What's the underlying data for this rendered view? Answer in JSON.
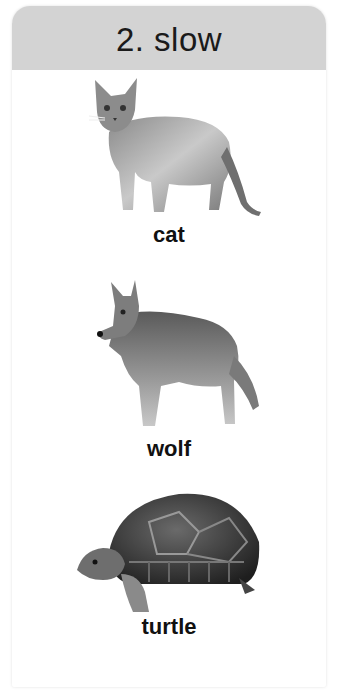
{
  "card": {
    "title": "2. slow",
    "header_color": "#d3d3d3"
  },
  "items": [
    {
      "name": "cat",
      "image": "cat-illustration",
      "label": "cat"
    },
    {
      "name": "wolf",
      "image": "wolf-illustration",
      "label": "wolf"
    },
    {
      "name": "turtle",
      "image": "turtle-illustration",
      "label": "turtle"
    }
  ]
}
